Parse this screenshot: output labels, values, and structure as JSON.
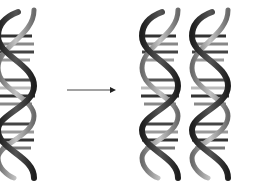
{
  "diagram": {
    "nodes": [
      {
        "id": "parent",
        "label": "",
        "icon": "dna-double-helix-icon"
      },
      {
        "id": "daughter-1",
        "label": "",
        "icon": "dna-double-helix-icon"
      },
      {
        "id": "daughter-2",
        "label": "",
        "icon": "dna-double-helix-icon"
      }
    ],
    "edges": [
      {
        "from": "parent",
        "to": "daughters",
        "icon": "arrow-right-icon"
      }
    ],
    "colors": {
      "background": "#ffffff",
      "strand_dark": "#2a2a2a",
      "strand_mid": "#7a7a7a",
      "strand_light": "#b5b5b5",
      "arrow": "#222222"
    }
  }
}
